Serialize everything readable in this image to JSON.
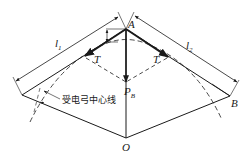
{
  "diagram": {
    "type": "pantograph-force-geometry",
    "colors": {
      "stroke": "#1a1a1a",
      "background": "#ffffff"
    },
    "labels": {
      "A": "A",
      "B": "B",
      "O": "O",
      "T_left": "T",
      "T_right": "T",
      "P": "P",
      "P_sub": "B",
      "l1": "l",
      "l1_sub": "1",
      "l2": "l",
      "l2_sub": "2",
      "centerline": "受电弓中心线"
    }
  }
}
